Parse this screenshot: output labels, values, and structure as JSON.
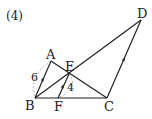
{
  "problem_label": "(4)",
  "points": {
    "A": {
      "label": "A",
      "x": 51,
      "y": 61
    },
    "B": {
      "label": "B",
      "x": 35,
      "y": 98
    },
    "C": {
      "label": "C",
      "x": 107,
      "y": 98
    },
    "D": {
      "label": "D",
      "x": 141,
      "y": 20
    },
    "E": {
      "label": "E",
      "x": 69,
      "y": 74
    },
    "F": {
      "label": "F",
      "x": 58,
      "y": 98
    }
  },
  "measurements": {
    "AB": "6",
    "EF": "4"
  },
  "segments": [
    "AB",
    "BC",
    "AC",
    "BD",
    "CD",
    "EF"
  ],
  "parallel_marks": [
    "AB",
    "EF",
    "CD"
  ],
  "colors": {
    "line": "#222222",
    "dashed": "#999999"
  }
}
